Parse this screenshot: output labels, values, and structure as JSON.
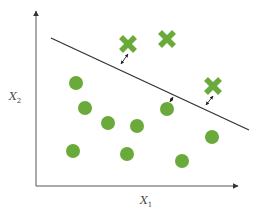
{
  "diagram": {
    "title": "",
    "type": "linear classifier / support vector margin illustration",
    "axes": {
      "x_label": "X",
      "x_subscript": "1",
      "y_label": "X",
      "y_subscript": "2",
      "color": "#555555"
    },
    "decision_boundary": {
      "from": [
        51,
        38
      ],
      "to": [
        249,
        130
      ],
      "color": "#333333"
    },
    "colors": {
      "point": "#6aaa3a",
      "line": "#333333",
      "axis": "#555555"
    },
    "class_x_points": [
      {
        "x": 128,
        "y": 44,
        "distance_arrow": {
          "from": [
            121,
            64
          ],
          "to": [
            128,
            54
          ]
        }
      },
      {
        "x": 167,
        "y": 39
      },
      {
        "x": 213,
        "y": 86,
        "distance_arrow": {
          "from": [
            206,
            105
          ],
          "to": [
            213,
            96
          ]
        }
      }
    ],
    "class_o_points": [
      {
        "x": 76,
        "y": 83
      },
      {
        "x": 85,
        "y": 108
      },
      {
        "x": 108,
        "y": 123
      },
      {
        "x": 137,
        "y": 126
      },
      {
        "x": 167,
        "y": 109,
        "distance_arrow": {
          "from": [
            173,
            97
          ],
          "to": [
            170,
            102
          ]
        }
      },
      {
        "x": 212,
        "y": 137
      },
      {
        "x": 73,
        "y": 151
      },
      {
        "x": 127,
        "y": 154
      },
      {
        "x": 182,
        "y": 161
      }
    ]
  }
}
